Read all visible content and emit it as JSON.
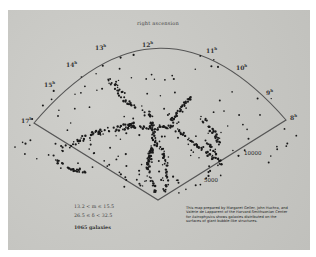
{
  "chart_title": "right ascension",
  "ra_labels": [
    {
      "h": "17",
      "x": 21,
      "y": 116
    },
    {
      "h": "15",
      "x": 44,
      "y": 80
    },
    {
      "h": "14",
      "x": 66,
      "y": 60
    },
    {
      "h": "13",
      "x": 95,
      "y": 43
    },
    {
      "h": "12",
      "x": 142,
      "y": 40
    },
    {
      "h": "11",
      "x": 206,
      "y": 46
    },
    {
      "h": "10",
      "x": 236,
      "y": 63
    },
    {
      "h": "9",
      "x": 266,
      "y": 88
    },
    {
      "h": "8",
      "x": 290,
      "y": 113
    }
  ],
  "hour_suffix": "h",
  "distance_labels": [
    {
      "text": "10000",
      "x": 244,
      "y": 150
    },
    {
      "text": "5000",
      "x": 204,
      "y": 177
    }
  ],
  "info": {
    "magnitude": "13.2 < m ≤ 15.5",
    "declination": "26.5 ≤ δ < 32.5",
    "count": "1065 galaxies"
  },
  "caption": "This map prepared by Margaret Geller, John Huchra, and Valérie de Lapparent of the Harvard-Smithsonian Center for Astrophysics shows galaxies distributed on the surfaces of giant bubble-like structures.",
  "colors": {
    "plate": "#c9c9c5",
    "line": "#555555",
    "dots": "#1a1a1a"
  }
}
